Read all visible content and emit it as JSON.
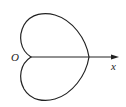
{
  "figure": {
    "type": "cardioid",
    "labels": {
      "origin": "O",
      "axis": "x"
    },
    "colors": {
      "stroke": "#222222",
      "background": "#ffffff"
    }
  }
}
